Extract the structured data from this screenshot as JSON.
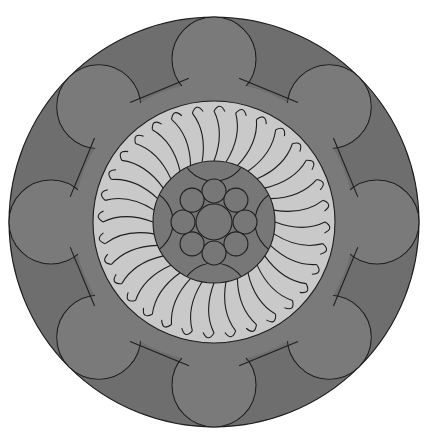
{
  "diagram": {
    "title": "Circular cross-section rosette diagram",
    "center": [
      214,
      222
    ],
    "colors": {
      "background": "#ffffff",
      "outer_ring": "#6e6e6e",
      "lobes": "#7a7a7a",
      "middle_band": "#7a7a7a",
      "light_ring": "#c9c9c9",
      "core": "#777777",
      "stroke": "#1e1e1e"
    },
    "outer_radius": 205,
    "lobe_count": 8,
    "lobe_radius": 42,
    "lobe_center_radius": 163,
    "middle_band_outer_radius": 140,
    "light_ring_radius": 121,
    "core_radius": 61,
    "petal_count": 32,
    "inner_circles": {
      "center_radius": 18,
      "ring_count": 8,
      "ring_radius": 12,
      "ring_distance": 31
    },
    "core_arc_count": 4
  }
}
